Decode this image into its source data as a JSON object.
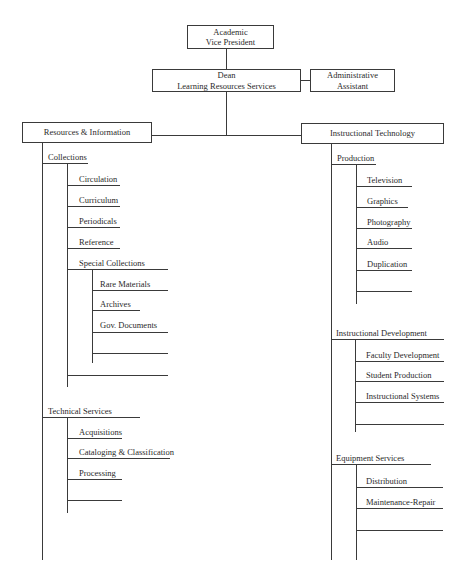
{
  "chart": {
    "top_box": {
      "line1": "Academic",
      "line2": "Vice President"
    },
    "dean_box": {
      "line1": "Dean",
      "line2": "Learning Resources Services"
    },
    "assistant_box": {
      "line1": "Administrative",
      "line2": "Assistant"
    },
    "left_division": {
      "title": "Resources & Information",
      "units": [
        {
          "name": "Collections",
          "items": [
            "Circulation",
            "Curriculum",
            "Periodicals",
            "Reference",
            "Special Collections"
          ],
          "sub_items": [
            "Rare Materials",
            "Archives",
            "Gov. Documents",
            "",
            ""
          ],
          "blank_slots": 1
        },
        {
          "name": "Technical Services",
          "items": [
            "Acquisitions",
            "Cataloging & Classification",
            "Processing",
            ""
          ]
        }
      ]
    },
    "right_division": {
      "title": "Instructional Technology",
      "units": [
        {
          "name": "Production",
          "items": [
            "Television",
            "Graphics",
            "Photography",
            "Audio",
            "Duplication",
            ""
          ]
        },
        {
          "name": "Instructional Development",
          "items": [
            "Faculty Development",
            "Student Production",
            "Instructional Systems",
            ""
          ]
        },
        {
          "name": "Equipment Services",
          "items": [
            "Distribution",
            "Maintenance-Repair",
            ""
          ]
        }
      ]
    }
  },
  "colors": {
    "line": "#3a3a3a",
    "text": "#2a2a2a",
    "background": "#ffffff"
  }
}
